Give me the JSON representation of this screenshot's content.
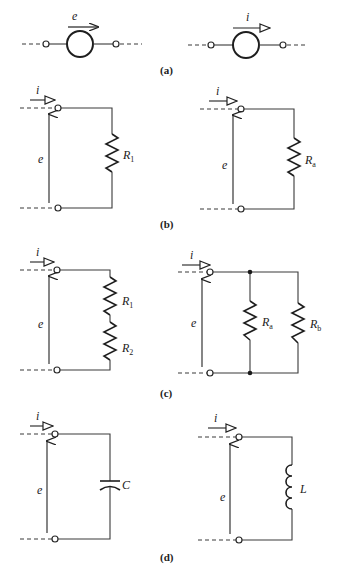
{
  "figure": {
    "panels": [
      {
        "id": "a",
        "caption": "(a)",
        "description": "Ideal voltage source (left) and ideal current source (right)",
        "elements": [
          {
            "type": "voltage-source",
            "arrow_label": "e"
          },
          {
            "type": "current-source",
            "arrow_label": "i"
          }
        ]
      },
      {
        "id": "b",
        "caption": "(b)",
        "description": "Single resistor loads",
        "circuits": [
          {
            "current_label": "i",
            "voltage_label": "e",
            "component": "resistor",
            "component_label": "R",
            "component_sub": "1"
          },
          {
            "current_label": "i",
            "voltage_label": "e",
            "component": "resistor",
            "component_label": "R",
            "component_sub": "a"
          }
        ]
      },
      {
        "id": "c",
        "caption": "(c)",
        "description": "Series resistors (left) and parallel resistors (right)",
        "circuits": [
          {
            "current_label": "i",
            "voltage_label": "e",
            "components": [
              {
                "label": "R",
                "sub": "1"
              },
              {
                "label": "R",
                "sub": "2"
              }
            ],
            "arrangement": "series"
          },
          {
            "current_label": "i",
            "voltage_label": "e",
            "components": [
              {
                "label": "R",
                "sub": "a"
              },
              {
                "label": "R",
                "sub": "b"
              }
            ],
            "arrangement": "parallel"
          }
        ]
      },
      {
        "id": "d",
        "caption": "(d)",
        "description": "Capacitor (left) and inductor (right)",
        "circuits": [
          {
            "current_label": "i",
            "voltage_label": "e",
            "component": "capacitor",
            "component_label": "C"
          },
          {
            "current_label": "i",
            "voltage_label": "e",
            "component": "inductor",
            "component_label": "L"
          }
        ]
      }
    ]
  },
  "labels": {
    "a_e": "e",
    "a_i": "i",
    "b_left_i": "i",
    "b_left_e": "e",
    "b_left_R": "R",
    "b_left_Rsub": "1",
    "b_right_i": "i",
    "b_right_e": "e",
    "b_right_R": "R",
    "b_right_Rsub": "a",
    "c_left_i": "i",
    "c_left_e": "e",
    "c_left_R1": "R",
    "c_left_R1sub": "1",
    "c_left_R2": "R",
    "c_left_R2sub": "2",
    "c_right_i": "i",
    "c_right_e": "e",
    "c_right_Ra": "R",
    "c_right_Rasub": "a",
    "c_right_Rb": "R",
    "c_right_Rbsub": "b",
    "d_left_i": "i",
    "d_left_e": "e",
    "d_left_C": "C",
    "d_right_i": "i",
    "d_right_e": "e",
    "d_right_L": "L",
    "cap_a": "(a)",
    "cap_b": "(b)",
    "cap_c": "(c)",
    "cap_d": "(d)"
  }
}
